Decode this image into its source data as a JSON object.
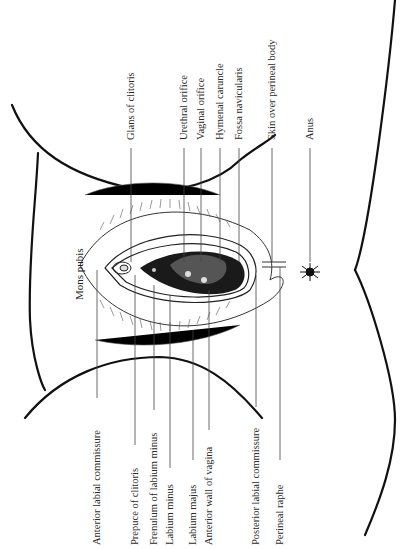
{
  "figure": {
    "region_label": "Mons pubis",
    "top_labels": [
      {
        "text": "Glans of clitoris",
        "x": 131
      },
      {
        "text": "Urethral orifice",
        "x": 184
      },
      {
        "text": "Vaginal orifice",
        "x": 201
      },
      {
        "text": "Hymenal caruncle",
        "x": 220
      },
      {
        "text": "Fossa navicularis",
        "x": 239
      },
      {
        "text": "Skin over perineal body",
        "x": 272
      },
      {
        "text": "Anus",
        "x": 310
      }
    ],
    "bottom_labels": [
      {
        "text": "Anterior labial commissure",
        "x": 97
      },
      {
        "text": "Prepuce of clitoris",
        "x": 135
      },
      {
        "text": "Frenulum of labium minus",
        "x": 154
      },
      {
        "text": "Labium minus",
        "x": 170
      },
      {
        "text": "Labium majus",
        "x": 193
      },
      {
        "text": "Anterior wall of vagina",
        "x": 209
      },
      {
        "text": "Posterior labial commissure",
        "x": 256
      },
      {
        "text": "Perineal raphe",
        "x": 280
      }
    ]
  }
}
